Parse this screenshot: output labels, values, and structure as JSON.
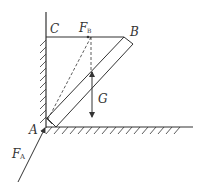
{
  "diagram": {
    "type": "statics-force-diagram",
    "labels": {
      "C": "C",
      "B": "B",
      "A": "A",
      "G": "G",
      "FB_main": "F",
      "FB_sub": "B",
      "FA_main": "F",
      "FA_sub": "A"
    },
    "elements": [
      "vertical wall with hatching",
      "horizontal floor with hatching",
      "horizontal rope CB",
      "inclined rod from A to B",
      "gravity arrow G",
      "force F_B along rope",
      "force F_A at A",
      "dashed construction lines"
    ],
    "colors": {
      "stroke": "#333333",
      "background": "#ffffff"
    }
  }
}
